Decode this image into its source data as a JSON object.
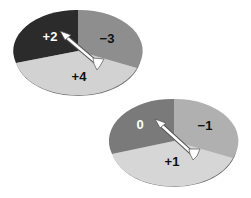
{
  "spinners": [
    {
      "name": "spinner-1",
      "sectors": [
        {
          "label": "+2",
          "color": "#2b2b2b",
          "text_color": "#ffffff"
        },
        {
          "label": "−3",
          "color": "#8e8e8e",
          "text_color": "#111111"
        },
        {
          "label": "+4",
          "color": "#d2d2d2",
          "text_color": "#111111"
        }
      ],
      "pointer": "arrow pointing to +2"
    },
    {
      "name": "spinner-2",
      "sectors": [
        {
          "label": "0",
          "color": "#7a7a7a",
          "text_color": "#ffffff"
        },
        {
          "label": "−1",
          "color": "#b0b0b0",
          "text_color": "#111111"
        },
        {
          "label": "+1",
          "color": "#d6d6d6",
          "text_color": "#111111"
        }
      ],
      "pointer": "arrow pointing to 0"
    }
  ]
}
